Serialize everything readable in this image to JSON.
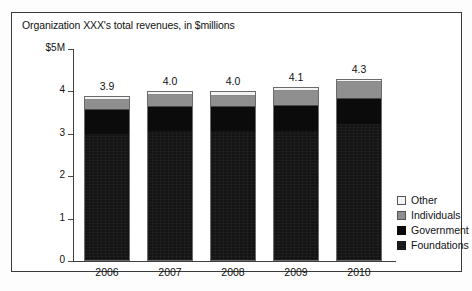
{
  "chart_data": {
    "type": "bar",
    "subtype": "stacked-bar",
    "title": "Organization XXX's total revenues, in $millions",
    "xlabel": "",
    "ylabel": "",
    "y_axis_top_label": "$5M",
    "categories": [
      "2006",
      "2007",
      "2008",
      "2009",
      "2010"
    ],
    "ylim": [
      0,
      5
    ],
    "yticks": [
      0,
      1,
      2,
      3,
      4,
      5
    ],
    "ytick_labels": [
      "0",
      "1",
      "2",
      "3",
      "4",
      "$5M"
    ],
    "grid": false,
    "legend_position": "right",
    "series": [
      {
        "name": "Foundations",
        "color": "#141414",
        "values": [
          3.0,
          3.08,
          3.07,
          3.07,
          3.25
        ]
      },
      {
        "name": "Government",
        "color": "#0b0b0b",
        "values": [
          0.58,
          0.57,
          0.58,
          0.6,
          0.6
        ]
      },
      {
        "name": "Individuals",
        "color": "#8f8f8f",
        "values": [
          0.25,
          0.28,
          0.27,
          0.36,
          0.4
        ]
      },
      {
        "name": "Other",
        "color": "#f2f2f2",
        "values": [
          0.07,
          0.07,
          0.08,
          0.07,
          0.05
        ]
      }
    ],
    "totals": [
      3.9,
      4.0,
      4.0,
      4.1,
      4.3
    ],
    "bar_labels": [
      "3.9",
      "4.0",
      "4.0",
      "4.1",
      "4.3"
    ],
    "legend": [
      {
        "label": "Other",
        "color": "#f2f2f2"
      },
      {
        "label": "Individuals",
        "color": "#8f8f8f"
      },
      {
        "label": "Government",
        "color": "#0b0b0b"
      },
      {
        "label": "Foundations",
        "color": "#141414"
      }
    ]
  }
}
